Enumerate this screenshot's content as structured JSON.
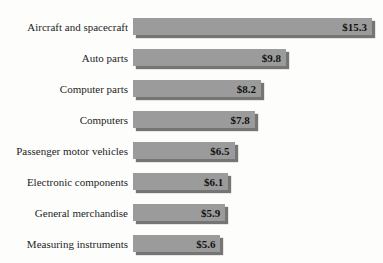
{
  "chart_data": {
    "type": "bar",
    "orientation": "horizontal",
    "title": "",
    "xlabel": "",
    "ylabel": "",
    "grid": false,
    "legend": false,
    "xlim": [
      0,
      15.3
    ],
    "categories": [
      "Aircraft and spacecraft",
      "Auto parts",
      "Computer parts",
      "Computers",
      "Passenger motor vehicles",
      "Electronic components",
      "General merchandise",
      "Measuring instruments"
    ],
    "values": [
      15.3,
      9.8,
      8.2,
      7.8,
      6.5,
      6.1,
      5.9,
      5.6
    ],
    "value_labels": [
      "$15.3",
      "$9.8",
      "$8.2",
      "$7.8",
      "$6.5",
      "$6.1",
      "$5.9",
      "$5.6"
    ],
    "bar_color": "#9b9b9b",
    "shadow_color": "#757575",
    "category_label_color": "#1e1e1e",
    "value_label_color": "#121212",
    "background_color": "#fdfdfc"
  }
}
